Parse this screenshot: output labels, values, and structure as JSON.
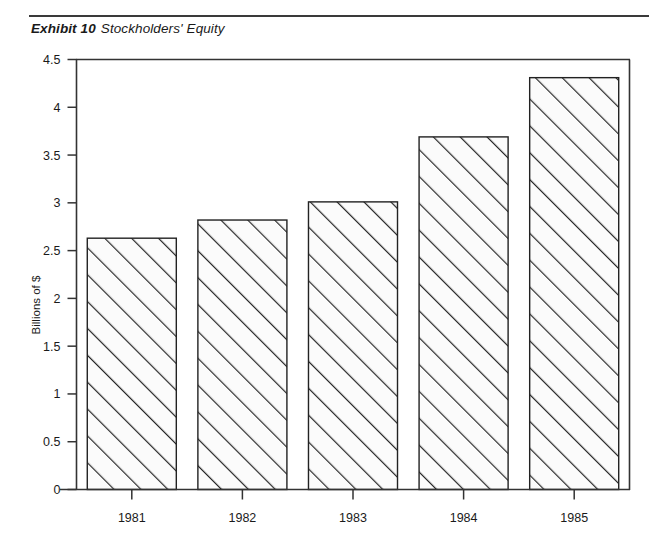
{
  "exhibit": {
    "number_label": "Exhibit 10",
    "title": "Stockholders' Equity"
  },
  "chart_data": {
    "type": "bar",
    "title": "Stockholders' Equity",
    "xlabel": "",
    "ylabel": "Billions of $",
    "categories": [
      "1981",
      "1982",
      "1983",
      "1984",
      "1985"
    ],
    "values": [
      2.63,
      2.82,
      3.01,
      3.69,
      4.31
    ],
    "ylim": [
      0,
      4.5
    ],
    "yticks": [
      "0",
      "0.5",
      "1",
      "1.5",
      "2",
      "2.5",
      "3",
      "3.5",
      "4",
      "4.5"
    ],
    "ytick_values": [
      0,
      0.5,
      1,
      1.5,
      2,
      2.5,
      3,
      3.5,
      4,
      4.5
    ],
    "grid": false,
    "legend": "none",
    "bar_fill": "#fbfbfb",
    "bar_edge": "#222222",
    "bar_hatch": "diagonal-45",
    "axis_color": "#333333"
  }
}
